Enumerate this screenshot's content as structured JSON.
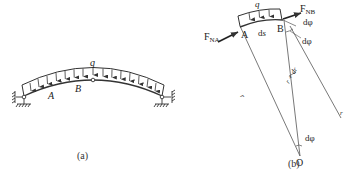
{
  "figure": {
    "panels": [
      {
        "id": "a",
        "caption": "(a)",
        "description": "three-hinged circular arch under uniform distributed load",
        "labels": {
          "load": "q",
          "point_a": "A",
          "point_b": "B"
        }
      },
      {
        "id": "b",
        "caption": "(b)",
        "description": "free-body diagram of arch element AB",
        "labels": {
          "load": "q",
          "point_a": "A",
          "point_b": "B",
          "arc_length": "ds",
          "force_a": "F",
          "force_a_sub": "NA",
          "force_b": "F",
          "force_b_sub": "NB",
          "angle_top": "dφ",
          "angle_mid": "dφ",
          "angle_center": "dφ",
          "radius": "r",
          "radius_plus": "r + dr",
          "radius_right": "r",
          "center": "O"
        }
      }
    ]
  },
  "colors": {
    "line": "#333333",
    "background": "#ffffff"
  }
}
